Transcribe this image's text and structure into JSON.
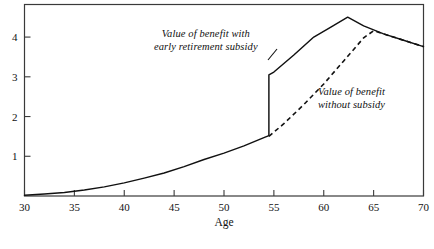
{
  "chart_data": {
    "type": "line",
    "title": "",
    "subtitle": "",
    "xlabel": "Age",
    "ylabel": "",
    "xlim": [
      30,
      70
    ],
    "ylim": [
      0,
      4.82
    ],
    "grid": false,
    "legend_position": "inline-annotations",
    "xticks": [
      30,
      35,
      40,
      45,
      50,
      55,
      60,
      65,
      70
    ],
    "xtick_labels": [
      "30",
      "35",
      "40",
      "45",
      "50",
      "55",
      "60",
      "65",
      "70"
    ],
    "yticks": [
      1,
      2,
      3,
      4
    ],
    "ytick_labels": [
      "1",
      "2",
      "3",
      "4"
    ],
    "series": [
      {
        "name": "Value of benefit with early retirement subsidy",
        "style": "solid",
        "color": "#111111",
        "x": [
          30,
          32,
          34,
          36,
          38,
          40,
          42,
          44,
          46,
          48,
          50,
          52,
          54,
          54.5,
          54.5,
          55,
          57,
          59,
          60.5,
          62.4,
          64,
          66,
          68,
          70
        ],
        "y": [
          0.02,
          0.05,
          0.09,
          0.15,
          0.23,
          0.33,
          0.45,
          0.58,
          0.74,
          0.92,
          1.08,
          1.26,
          1.47,
          1.52,
          3.05,
          3.12,
          3.55,
          4.0,
          4.22,
          4.5,
          4.28,
          4.08,
          3.92,
          3.76
        ]
      },
      {
        "name": "Value of benefit without subsidy",
        "style": "dashed",
        "color": "#111111",
        "x": [
          54.5,
          56,
          58,
          60,
          62,
          64,
          65,
          66,
          68,
          70
        ],
        "y": [
          1.5,
          1.82,
          2.3,
          2.82,
          3.4,
          3.98,
          4.16,
          4.08,
          3.92,
          3.76
        ]
      }
    ],
    "annotations": [
      {
        "id": "anno-subsidy",
        "lines": [
          "Value of benefit with",
          "early retirement subsidy"
        ],
        "italic": true
      },
      {
        "id": "anno-nosubsidy",
        "lines": [
          "Value of benefit",
          "without subsidy"
        ],
        "italic": true
      }
    ]
  },
  "figure": {
    "axis_color": "#3a3a3a",
    "line_color": "#111111",
    "background": "#ffffff"
  }
}
